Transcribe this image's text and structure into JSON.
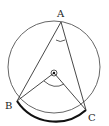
{
  "diagram": {
    "type": "circle-geometry",
    "points": {
      "A": {
        "label": "A",
        "x": 61,
        "y": 22
      },
      "B": {
        "label": "B",
        "x": 17,
        "y": 101
      },
      "C": {
        "label": "C",
        "x": 86,
        "y": 110
      },
      "O": {
        "label": "",
        "x": 54,
        "y": 73
      }
    },
    "circle": {
      "cx": 54,
      "cy": 67,
      "r": 46
    },
    "highlighted_arc": "BC",
    "colors": {
      "stroke": "#333333",
      "background": "#ffffff"
    }
  }
}
